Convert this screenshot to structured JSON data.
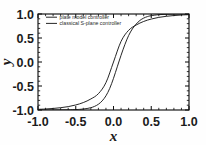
{
  "figure": {
    "background_color": "#fefefe",
    "axis_color": "#111111",
    "text_color": "#1b1b1b"
  },
  "chart_data": {
    "type": "line",
    "title": "",
    "xlabel": "x",
    "ylabel": "y",
    "xlim": [
      -1.0,
      1.0
    ],
    "ylim": [
      -1.0,
      1.0
    ],
    "xticks": [
      "-1.0",
      "-0.5",
      "0.0",
      "0.5",
      "1.0"
    ],
    "xtick_values": [
      -1.0,
      -0.5,
      0.0,
      0.5,
      1.0
    ],
    "yticks": [
      "-1.0",
      "-0.5",
      "0.0",
      "0.5",
      "1.0"
    ],
    "ytick_values": [
      -1.0,
      -0.5,
      0.0,
      0.5,
      1.0
    ],
    "minor_ticks_per_interval": 4,
    "grid": false,
    "legend_position": "upper left",
    "series": [
      {
        "name": "plate model controller",
        "color": "#1a1a1a",
        "x": [
          -1.0,
          -0.9,
          -0.8,
          -0.7,
          -0.6,
          -0.5,
          -0.45,
          -0.4,
          -0.35,
          -0.3,
          -0.25,
          -0.2,
          -0.15,
          -0.1,
          -0.05,
          0.0,
          0.05,
          0.1,
          0.15,
          0.2,
          0.25,
          0.3,
          0.35,
          0.4,
          0.45,
          0.5,
          0.6,
          0.7,
          0.8,
          0.9,
          1.0
        ],
        "y": [
          -1.0,
          -1.0,
          -0.999,
          -0.998,
          -0.996,
          -0.991,
          -0.987,
          -0.98,
          -0.969,
          -0.952,
          -0.924,
          -0.88,
          -0.81,
          -0.705,
          -0.55,
          -0.34,
          -0.1,
          0.14,
          0.36,
          0.55,
          0.69,
          0.79,
          0.866,
          0.915,
          0.946,
          0.965,
          0.986,
          0.994,
          0.997,
          0.999,
          1.0
        ]
      },
      {
        "name": "classical S-plane controller",
        "color": "#1a1a1a",
        "x": [
          -1.0,
          -0.9,
          -0.8,
          -0.7,
          -0.6,
          -0.5,
          -0.4,
          -0.3,
          -0.2,
          -0.1,
          0.0,
          0.1,
          0.2,
          0.3,
          0.4,
          0.5,
          0.6,
          0.7,
          0.8,
          0.9,
          1.0
        ],
        "y": [
          -0.986,
          -0.979,
          -0.968,
          -0.952,
          -0.93,
          -0.895,
          -0.845,
          -0.77,
          -0.66,
          -0.43,
          0.0,
          0.43,
          0.66,
          0.77,
          0.845,
          0.895,
          0.93,
          0.952,
          0.968,
          0.979,
          0.986
        ]
      }
    ]
  },
  "legend": {
    "entries": [
      {
        "label": "plate model controller"
      },
      {
        "label": "classical S-plane controller"
      }
    ]
  }
}
